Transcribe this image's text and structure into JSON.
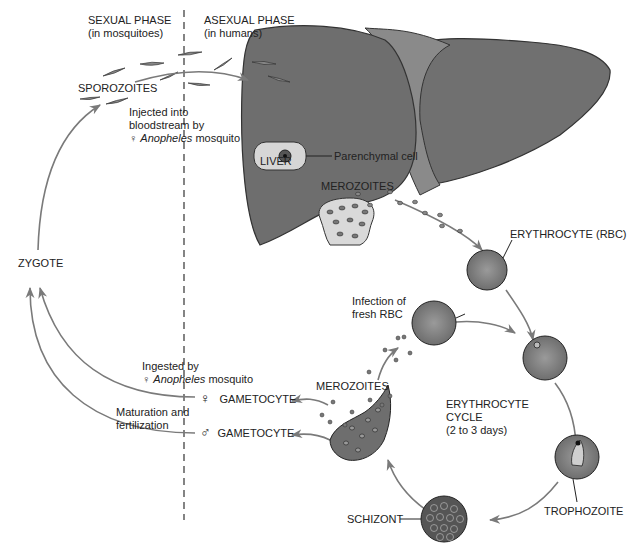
{
  "phases": {
    "sexual": {
      "title": "SEXUAL PHASE",
      "subtitle": "(in mosquitoes)"
    },
    "asexual": {
      "title": "ASEXUAL PHASE",
      "subtitle": "(in humans)"
    }
  },
  "labels": {
    "sporozoites": "SPOROZOITES",
    "injected_line1": "Injected into",
    "injected_line2": "bloodstream by",
    "injected_symbol": "♀",
    "injected_species": "Anopheles",
    "injected_suffix": "mosquito",
    "parenchymal": "Parenchymal cell",
    "liver": "LIVER",
    "merozoites_liver": "MEROZOITES",
    "erythrocyte": "ERYTHROCYTE (RBC)",
    "zygote": "ZYGOTE",
    "infection_line1": "Infection of",
    "infection_line2": "fresh RBC",
    "ingested_line1": "Ingested by",
    "ingested_symbol": "♀",
    "ingested_species": "Anopheles",
    "ingested_suffix": "mosquito",
    "merozoites_rbc": "MEROZOITES",
    "female_symbol": "♀",
    "female_gametocyte": "GAMETOCYTE",
    "maturation_line1": "Maturation and",
    "maturation_line2": "fertilization",
    "male_symbol": "♂",
    "male_gametocyte": "GAMETOCYTE",
    "cycle_line1": "ERYTHROCYTE",
    "cycle_line2": "CYCLE",
    "cycle_line3": "(2 to 3 days)",
    "trophozoite": "TROPHOZOITE",
    "schizont": "SCHIZONT"
  },
  "colors": {
    "liver": "#6f6f6f",
    "liver_dark": "#5e5e5e",
    "ligament": "#8a8a8a",
    "cell_light": "#d9d9d9",
    "rbc": "#7d7d7d",
    "arrow": "#7a7a7a",
    "text": "#222222"
  }
}
